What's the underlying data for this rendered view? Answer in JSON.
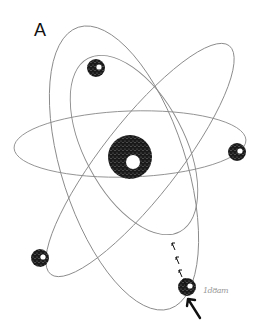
{
  "diagram": {
    "type": "atom-illustration",
    "panel_label": "A",
    "signature": "1d8am",
    "colors": {
      "background": "#ffffff",
      "orbit": "#8a8a8a",
      "particle": "#1a1a1a",
      "arrow": "#111111",
      "label": "#111111"
    },
    "nucleus": {
      "cx": 130,
      "cy": 157,
      "r": 22,
      "inner_r": 7
    },
    "electrons": [
      {
        "name": "electron-top",
        "cx": 96,
        "cy": 68,
        "r": 9
      },
      {
        "name": "electron-right",
        "cx": 237,
        "cy": 152,
        "r": 9
      },
      {
        "name": "electron-lower-left",
        "cx": 40,
        "cy": 258,
        "r": 9
      },
      {
        "name": "electron-bottom-right",
        "cx": 187,
        "cy": 287,
        "r": 9
      }
    ],
    "orbits": [
      {
        "name": "orbit-horizontal",
        "cx": 130,
        "cy": 144,
        "rx": 116,
        "ry": 33,
        "rotate": -2
      },
      {
        "name": "orbit-tall-outer",
        "cx": 124,
        "cy": 168,
        "rx": 62,
        "ry": 148,
        "rotate": -18
      },
      {
        "name": "orbit-diagonal",
        "cx": 140,
        "cy": 160,
        "rx": 145,
        "ry": 38,
        "rotate": -52
      },
      {
        "name": "orbit-inner",
        "cx": 134,
        "cy": 145,
        "rx": 50,
        "ry": 98,
        "rotate": -28
      }
    ],
    "small_arrows_count": 4,
    "big_arrow": {
      "from": [
        200,
        318
      ],
      "to": [
        188,
        299
      ]
    }
  }
}
